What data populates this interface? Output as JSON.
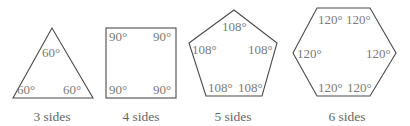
{
  "diagram": {
    "shapes": [
      {
        "name": "triangle",
        "caption": "3 sides",
        "angles": [
          "60°",
          "60°",
          "60°"
        ]
      },
      {
        "name": "square",
        "caption": "4 sides",
        "angles": [
          "90°",
          "90°",
          "90°",
          "90°"
        ]
      },
      {
        "name": "pentagon",
        "caption": "5 sides",
        "angles": [
          "108°",
          "108°",
          "108°",
          "108°",
          "108°"
        ]
      },
      {
        "name": "hexagon",
        "caption": "6 sides",
        "angles": [
          "120°",
          "120°",
          "120°",
          "120°",
          "120°",
          "120°"
        ]
      }
    ],
    "colors": {
      "stroke": "#4a4a4a",
      "angle_text": "#7a7a7a",
      "caption_text": "#666666"
    }
  }
}
